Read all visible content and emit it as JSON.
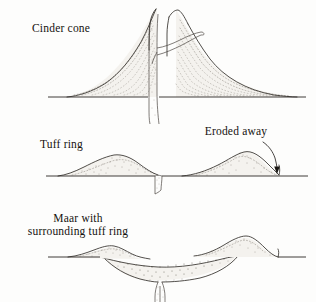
{
  "figure": {
    "background_color": "#fdfdfc",
    "ink_color": "#2b2724",
    "stipple_color": "#6e6860",
    "panels": [
      {
        "id": "cinder-cone",
        "label": "Cinder cone",
        "label_position": {
          "x": 32,
          "y": 32
        },
        "description": "Symmetrical steep-sided cone with summit crater, central vertical conduit extending below ground level, a lateral dike branching to the upper right flank, and inward-dipping dotted bedding layers",
        "ground_line_y": 97,
        "summit_y": 8,
        "features": [
          "summit-crater",
          "central-conduit",
          "lateral-dike",
          "dipping-beds",
          "ground-line"
        ]
      },
      {
        "id": "tuff-ring",
        "label": "Tuff ring",
        "label_position": {
          "x": 40,
          "y": 148
        },
        "annotation": "Eroded away",
        "annotation_position": {
          "x": 236,
          "y": 135
        },
        "description": "Two low broad tuff mounds flanking a narrow central conduit that is cut down below the ground surface; curved arrow marks the eroded right margin",
        "ground_line_y": 176,
        "features": [
          "left-tuff-mound",
          "right-tuff-mound",
          "narrow-conduit",
          "eroded-away-arrow",
          "ground-line"
        ]
      },
      {
        "id": "maar",
        "label_line1": "Maar with",
        "label_line2": "surrounding tuff ring",
        "label_position": {
          "x": 78,
          "y": 222
        },
        "description": "Broad bowl-shaped crater cut below ground level, filled with stippled breccia, narrowing downward into a diatreme and feeder dike; low tuff ring mounds on both rims",
        "ground_line_y": 257,
        "features": [
          "crater-bowl",
          "breccia-fill",
          "diatreme",
          "feeder-dike",
          "left-rim-mound",
          "right-rim-mound",
          "ground-line"
        ]
      }
    ]
  }
}
